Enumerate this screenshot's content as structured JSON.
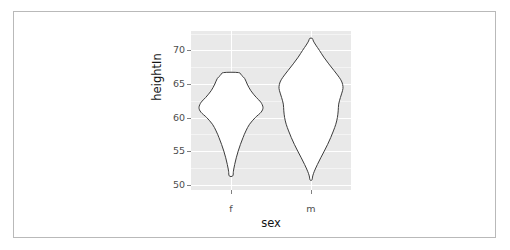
{
  "figure": {
    "background_color": "#ffffff",
    "frame_color": "#b9b9b9",
    "panel_color": "#e9e9e9",
    "grid_major_color": "#ffffff",
    "violin_line_color": "#3c3c3c",
    "violin_fill_color": "#ffffff"
  },
  "chart_data": {
    "type": "violin",
    "title": "",
    "subtitle": "",
    "xlabel": "sex",
    "ylabel": "heightIn",
    "categories": [
      "f",
      "m"
    ],
    "xtick_labels": [
      "f",
      "m"
    ],
    "ytick_labels": [
      "50",
      "55",
      "60",
      "65",
      "70"
    ],
    "ytick_values": [
      50,
      55,
      60,
      65,
      70
    ],
    "ylim": [
      49.2,
      72.9
    ],
    "grid": true,
    "grid_minor": true,
    "legend": "none",
    "series": [
      {
        "name": "f",
        "center_value": 61.5,
        "min": 51.3,
        "max": 66.7,
        "max_width_value": 61.5,
        "density_profile": [
          {
            "y": 51.3,
            "w": 0.055
          },
          {
            "y": 52.0,
            "w": 0.075
          },
          {
            "y": 53.0,
            "w": 0.115
          },
          {
            "y": 54.0,
            "w": 0.165
          },
          {
            "y": 55.0,
            "w": 0.225
          },
          {
            "y": 56.0,
            "w": 0.295
          },
          {
            "y": 57.0,
            "w": 0.375
          },
          {
            "y": 58.0,
            "w": 0.465
          },
          {
            "y": 59.0,
            "w": 0.58
          },
          {
            "y": 60.0,
            "w": 0.76
          },
          {
            "y": 60.8,
            "w": 0.94
          },
          {
            "y": 61.5,
            "w": 1.0
          },
          {
            "y": 62.3,
            "w": 0.93
          },
          {
            "y": 63.0,
            "w": 0.79
          },
          {
            "y": 64.0,
            "w": 0.62
          },
          {
            "y": 65.0,
            "w": 0.505
          },
          {
            "y": 65.8,
            "w": 0.43
          },
          {
            "y": 66.3,
            "w": 0.33
          },
          {
            "y": 66.7,
            "w": 0.23
          }
        ]
      },
      {
        "name": "m",
        "center_value": 64.5,
        "min": 50.7,
        "max": 71.8,
        "max_width_value": 64.5,
        "density_profile": [
          {
            "y": 50.7,
            "w": 0.03
          },
          {
            "y": 51.3,
            "w": 0.055
          },
          {
            "y": 52.0,
            "w": 0.105
          },
          {
            "y": 53.0,
            "w": 0.2
          },
          {
            "y": 54.0,
            "w": 0.305
          },
          {
            "y": 55.0,
            "w": 0.415
          },
          {
            "y": 56.0,
            "w": 0.52
          },
          {
            "y": 57.0,
            "w": 0.615
          },
          {
            "y": 58.0,
            "w": 0.7
          },
          {
            "y": 59.0,
            "w": 0.775
          },
          {
            "y": 60.0,
            "w": 0.825
          },
          {
            "y": 61.0,
            "w": 0.85
          },
          {
            "y": 62.0,
            "w": 0.865
          },
          {
            "y": 63.0,
            "w": 0.92
          },
          {
            "y": 64.0,
            "w": 0.985
          },
          {
            "y": 64.6,
            "w": 1.0
          },
          {
            "y": 65.3,
            "w": 0.965
          },
          {
            "y": 66.0,
            "w": 0.88
          },
          {
            "y": 67.0,
            "w": 0.72
          },
          {
            "y": 68.0,
            "w": 0.555
          },
          {
            "y": 69.0,
            "w": 0.4
          },
          {
            "y": 70.0,
            "w": 0.265
          },
          {
            "y": 70.8,
            "w": 0.15
          },
          {
            "y": 71.4,
            "w": 0.075
          },
          {
            "y": 71.8,
            "w": 0.04
          }
        ]
      }
    ]
  }
}
